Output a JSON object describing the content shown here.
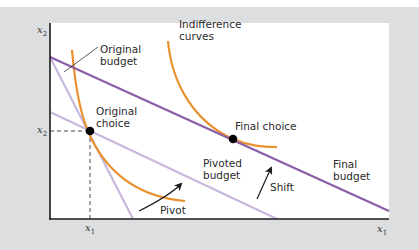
{
  "diagram": {
    "title": "",
    "axes": {
      "x_label": "x",
      "x_sub": "1",
      "y_label": "x",
      "y_sub": "2",
      "x_tick_label": "x",
      "x_tick_sub": "1",
      "y_tick_label": "x",
      "y_tick_sub": "2"
    },
    "labels": {
      "original_budget": "Original\nbudget",
      "indifference_curves": "Indifference\ncurves",
      "original_choice": "Original\nchoice",
      "final_choice": "Final choice",
      "pivoted_budget": "Pivoted\nbudget",
      "final_budget": "Final\nbudget",
      "shift": "Shift",
      "pivot": "Pivot"
    },
    "colors": {
      "background": "#dcdee0",
      "panel": "#ffffff",
      "final_budget": "#8a5fa8",
      "light_budget": "#c9b8dc",
      "indifference": "#e8912e",
      "axis": "#1a1a1a",
      "point": "#000000"
    }
  }
}
